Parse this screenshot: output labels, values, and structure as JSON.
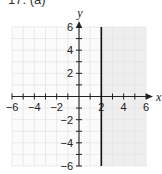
{
  "problem_label": "17. (a)",
  "chart_data": {
    "type": "line",
    "title": "",
    "xlabel": "x",
    "ylabel": "y",
    "xlim": [
      -6,
      6
    ],
    "ylim": [
      -6,
      6
    ],
    "grid": true,
    "x_ticks": [
      -6,
      -4,
      -2,
      2,
      4,
      6
    ],
    "y_ticks": [
      6,
      4,
      2,
      -2,
      -4,
      -6
    ],
    "x_tick_labels": [
      "−6",
      "−4",
      "−2",
      "2",
      "4",
      "6"
    ],
    "y_tick_labels": [
      "6",
      "4",
      "2",
      "−2",
      "−4",
      "−6"
    ],
    "series": [
      {
        "name": "x = 2",
        "equation": "x = 2",
        "kind": "vertical line",
        "points": [
          [
            2,
            -6
          ],
          [
            2,
            6
          ]
        ]
      }
    ],
    "shaded_region": {
      "description": "x >= 2",
      "x_range": [
        2,
        6
      ],
      "y_range": [
        -6,
        6
      ],
      "color": "#eeeeee"
    },
    "colors": {
      "background": "#ffffff",
      "grid": "#e6e6e6",
      "shade": "#eeeeee",
      "axis": "#222222",
      "line": "#111111"
    }
  }
}
